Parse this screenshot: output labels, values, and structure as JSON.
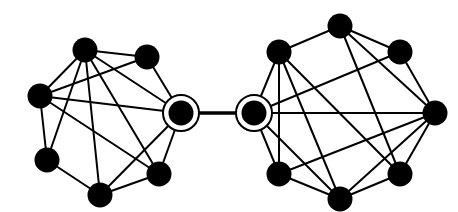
{
  "diagram": {
    "type": "graph",
    "colors": {
      "node": "#000000",
      "edge": "#000000",
      "background": "#ffffff"
    },
    "nodes": [
      {
        "id": "A",
        "x": 85,
        "y": 50,
        "cluster": "left"
      },
      {
        "id": "B",
        "x": 147,
        "y": 57,
        "cluster": "left"
      },
      {
        "id": "C",
        "x": 40,
        "y": 96,
        "cluster": "left"
      },
      {
        "id": "D",
        "x": 181,
        "y": 113,
        "cluster": "left",
        "highlighted": true
      },
      {
        "id": "E",
        "x": 47,
        "y": 160,
        "cluster": "left"
      },
      {
        "id": "F",
        "x": 100,
        "y": 195,
        "cluster": "left"
      },
      {
        "id": "G",
        "x": 159,
        "y": 174,
        "cluster": "left"
      },
      {
        "id": "H",
        "x": 254,
        "y": 113,
        "cluster": "right",
        "highlighted": true
      },
      {
        "id": "I",
        "x": 279,
        "y": 52,
        "cluster": "right"
      },
      {
        "id": "J",
        "x": 340,
        "y": 26,
        "cluster": "right"
      },
      {
        "id": "K",
        "x": 400,
        "y": 52,
        "cluster": "right"
      },
      {
        "id": "L",
        "x": 435,
        "y": 113,
        "cluster": "right"
      },
      {
        "id": "M",
        "x": 400,
        "y": 174,
        "cluster": "right"
      },
      {
        "id": "N",
        "x": 340,
        "y": 199,
        "cluster": "right"
      },
      {
        "id": "O",
        "x": 279,
        "y": 174,
        "cluster": "right"
      }
    ],
    "edges": [
      [
        "A",
        "B"
      ],
      [
        "A",
        "C"
      ],
      [
        "A",
        "D"
      ],
      [
        "A",
        "E"
      ],
      [
        "A",
        "F"
      ],
      [
        "A",
        "G"
      ],
      [
        "B",
        "C"
      ],
      [
        "B",
        "D"
      ],
      [
        "C",
        "D"
      ],
      [
        "C",
        "E"
      ],
      [
        "C",
        "G"
      ],
      [
        "D",
        "F"
      ],
      [
        "D",
        "G"
      ],
      [
        "E",
        "F"
      ],
      [
        "F",
        "G"
      ],
      [
        "D",
        "H"
      ],
      [
        "H",
        "I"
      ],
      [
        "H",
        "O"
      ],
      [
        "H",
        "K"
      ],
      [
        "H",
        "L"
      ],
      [
        "H",
        "N"
      ],
      [
        "I",
        "J"
      ],
      [
        "I",
        "O"
      ],
      [
        "I",
        "N"
      ],
      [
        "I",
        "M"
      ],
      [
        "J",
        "K"
      ],
      [
        "J",
        "L"
      ],
      [
        "J",
        "M"
      ],
      [
        "K",
        "L"
      ],
      [
        "L",
        "M"
      ],
      [
        "L",
        "N"
      ],
      [
        "L",
        "O"
      ],
      [
        "M",
        "N"
      ],
      [
        "N",
        "O"
      ]
    ],
    "bridge_edge": [
      "D",
      "H"
    ]
  }
}
